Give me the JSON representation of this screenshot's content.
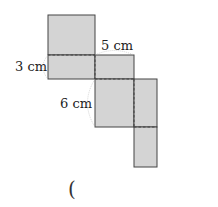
{
  "figure": {
    "labels": {
      "height": "3 cm",
      "width": "5 cm",
      "length": "6 cm"
    },
    "answer_blank": "("
  },
  "colors": {
    "face_fill": "#d4d4d4",
    "edge": "#444444"
  }
}
